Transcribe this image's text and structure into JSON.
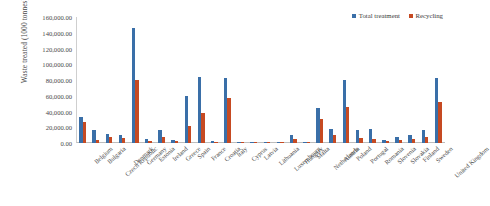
{
  "chart_data": {
    "type": "bar",
    "title": "",
    "subtitle": "",
    "xlabel": "",
    "ylabel": "Waste treated (1000 tonnes)",
    "ylim": [
      0,
      160000
    ],
    "ytick_step": 20000,
    "ytick_labels": [
      "160,000.00",
      "140,000.00",
      "120,000.00",
      "100,000.00",
      "80,000.00",
      "60,000.00",
      "40,000.00",
      "20,000.00",
      "0.00"
    ],
    "grid": false,
    "legend_position": "top-right",
    "categories": [
      "Belgium",
      "Bulgaria",
      "Czech Republic",
      "Denmark",
      "Germany",
      "Estonia",
      "Ireland",
      "Greece",
      "Spain",
      "France",
      "Croatia",
      "Italy",
      "Cyprus",
      "Latvia",
      "Lithuania",
      "Luxembourg",
      "Hungary",
      "Malta",
      "Netherlands",
      "Austria",
      "Poland",
      "Portugal",
      "Romania",
      "Slovenia",
      "Slovakia",
      "Finland",
      "Sweden",
      "United Kingdom"
    ],
    "series": [
      {
        "name": "Total treatment",
        "color": "#3A6FA8",
        "values": [
          33000,
          16000,
          11000,
          10500,
          146000,
          4500,
          17000,
          3500,
          60000,
          84000,
          3000,
          82000,
          1200,
          900,
          1500,
          1200,
          10000,
          700,
          45000,
          18000,
          80000,
          16000,
          18000,
          4000,
          8000,
          10000,
          16000,
          83000
        ]
      },
      {
        "name": "Recycling",
        "color": "#C64A22",
        "values": [
          27000,
          3500,
          7500,
          6500,
          80000,
          2500,
          7500,
          2200,
          21000,
          38000,
          1500,
          57000,
          500,
          400,
          800,
          600,
          4500,
          200,
          31000,
          10000,
          46000,
          6000,
          5000,
          3000,
          4000,
          5000,
          8000,
          52000
        ]
      }
    ]
  },
  "legend": {
    "items": [
      {
        "label": "Total treatment",
        "color": "#3A6FA8"
      },
      {
        "label": "Recycling",
        "color": "#C64A22"
      }
    ]
  }
}
